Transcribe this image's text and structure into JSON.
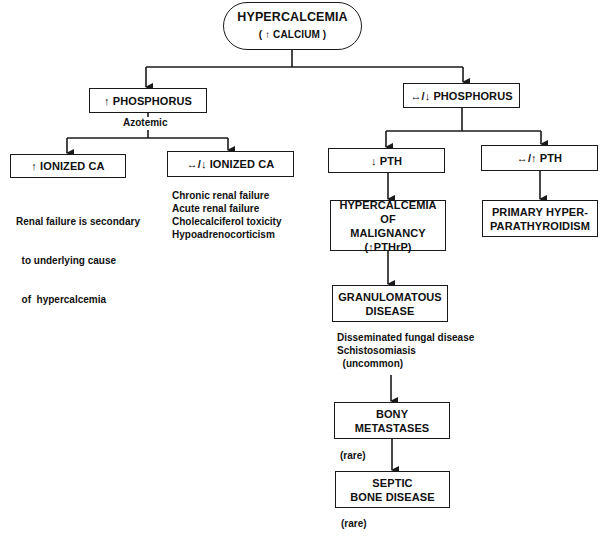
{
  "diagram": {
    "root": {
      "title": "HYPERCALCEMIA",
      "subtitle": "( ↑ CALCIUM )"
    },
    "left_branch": {
      "label": "↑ PHOSPHORUS",
      "note": "Azotemic",
      "children": [
        {
          "label": "↑ IONIZED CA",
          "notes": [
            "Renal failure is secondary",
            "  to underlying cause",
            "  of  hypercalcemia"
          ]
        },
        {
          "label": "↔/↓ IONIZED CA",
          "notes": [
            "Chronic renal failure",
            "Acute renal failure",
            "Cholecalciferol toxicity",
            "Hypoadrenocorticism"
          ]
        }
      ]
    },
    "right_branch": {
      "label": "↔/↓ PHOSPHORUS",
      "children": [
        {
          "label": "↓ PTH",
          "chain": [
            {
              "lines": [
                "HYPERCALCEMIA OF",
                "MALIGNANCY",
                "(↑PTHrP)"
              ]
            },
            {
              "lines": [
                "GRANULOMATOUS",
                "DISEASE"
              ],
              "notes": [
                "Disseminated fungal disease",
                "Schistosomiasis",
                "  (uncommon)"
              ]
            },
            {
              "lines": [
                "BONY",
                "METASTASES"
              ],
              "notes": [
                "(rare)"
              ]
            },
            {
              "lines": [
                "SEPTIC",
                "BONE DISEASE"
              ],
              "notes": [
                "(rare)"
              ]
            }
          ]
        },
        {
          "label": "↔/↑ PTH",
          "result": {
            "lines": [
              "PRIMARY HYPER-",
              "PARATHYROIDISM"
            ]
          }
        }
      ]
    }
  },
  "colors": {
    "line": "#1a1a1a",
    "background": "#ffffff",
    "text": "#111111"
  }
}
